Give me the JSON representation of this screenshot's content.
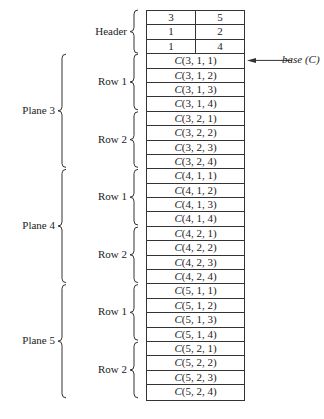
{
  "header": {
    "label": "Header",
    "rows": [
      [
        "3",
        "5"
      ],
      [
        "1",
        "2"
      ],
      [
        "1",
        "4"
      ]
    ]
  },
  "planes": [
    {
      "label": "Plane 3",
      "rows": [
        {
          "label": "Row 1",
          "cells": [
            "C(3, 1, 1)",
            "C(3, 1, 2)",
            "C(3, 1, 3)",
            "C(3, 1, 4)"
          ]
        },
        {
          "label": "Row 2",
          "cells": [
            "C(3, 2, 1)",
            "C(3, 2, 2)",
            "C(3, 2, 3)",
            "C(3, 2, 4)"
          ]
        }
      ]
    },
    {
      "label": "Plane 4",
      "rows": [
        {
          "label": "Row 1",
          "cells": [
            "C(4, 1, 1)",
            "C(4, 1, 2)",
            "C(4, 1, 3)",
            "C(4, 1, 4)"
          ]
        },
        {
          "label": "Row 2",
          "cells": [
            "C(4, 2, 1)",
            "C(4, 2, 2)",
            "C(4, 2, 3)",
            "C(4, 2, 4)"
          ]
        }
      ]
    },
    {
      "label": "Plane 5",
      "rows": [
        {
          "label": "Row 1",
          "cells": [
            "C(5, 1, 1)",
            "C(5, 1, 2)",
            "C(5, 1, 3)",
            "C(5, 1, 4)"
          ]
        },
        {
          "label": "Row 2",
          "cells": [
            "C(5, 2, 1)",
            "C(5, 2, 2)",
            "C(5, 2, 3)",
            "C(5, 2, 4)"
          ]
        }
      ]
    }
  ],
  "pointer": {
    "label": "base (C)"
  }
}
